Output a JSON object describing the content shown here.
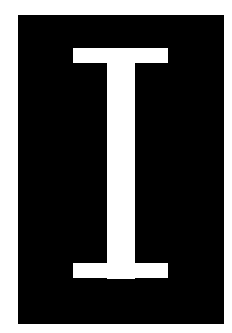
{
  "panel": {
    "background_color": "#000000",
    "glyph": "I",
    "glyph_color": "#ffffff"
  },
  "page": {
    "background_color": "#ffffff"
  }
}
